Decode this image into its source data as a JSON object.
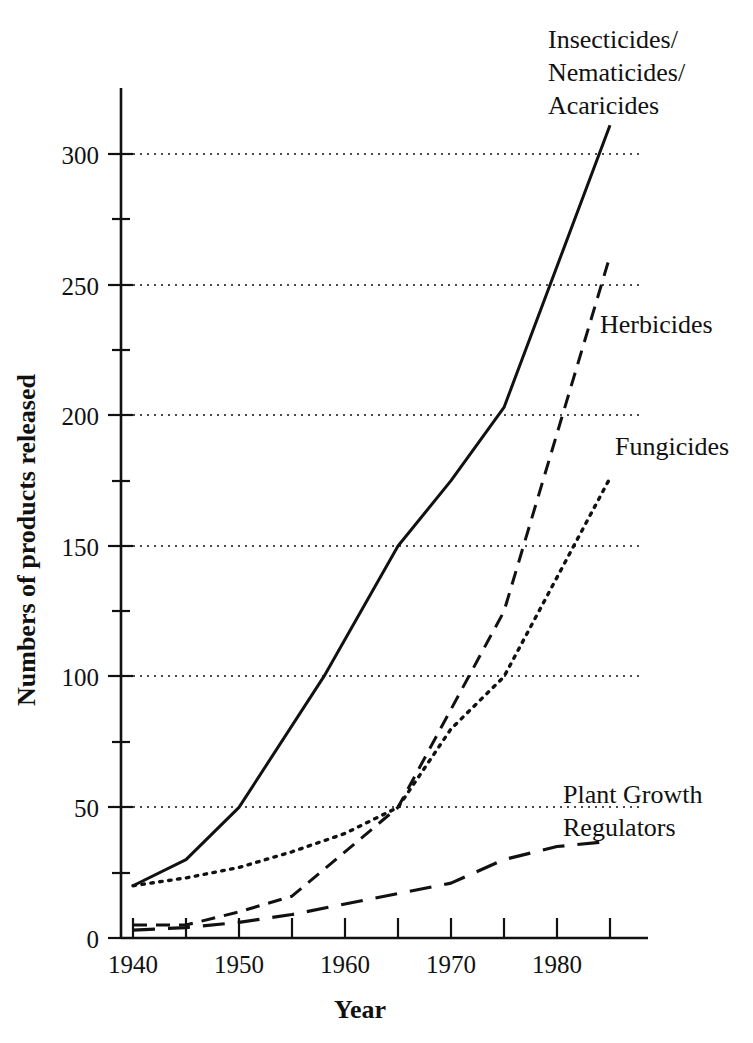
{
  "chart_data": {
    "type": "line",
    "title": "",
    "xlabel": "Year",
    "ylabel": "Numbers of products released",
    "xlim": [
      1940,
      1987
    ],
    "ylim": [
      0,
      320
    ],
    "grid": true,
    "grid_axis": "y",
    "legend": "inline-series-labels",
    "x_ticks_major": [
      1940,
      1950,
      1960,
      1970,
      1980
    ],
    "x_ticks_minor": [
      1945,
      1955,
      1965,
      1975,
      1985
    ],
    "x_tick_labels": [
      "1940",
      "1950",
      "1960",
      "1970",
      "1980"
    ],
    "y_ticks_major": [
      0,
      50,
      100,
      150,
      200,
      250,
      300
    ],
    "y_ticks_minor": [
      25,
      75,
      125,
      175,
      225,
      275
    ],
    "y_tick_labels": [
      "0",
      "50",
      "100",
      "150",
      "200",
      "250",
      "300"
    ],
    "series": [
      {
        "name": "Insecticides/\nNematicides/\nAcaricides",
        "label": "Insecticides/",
        "label_line2": "Nematicides/",
        "label_line3": "Acaricides",
        "style": "solid",
        "x": [
          1940,
          1945,
          1950,
          1958,
          1965,
          1970,
          1975,
          1985
        ],
        "values": [
          20,
          30,
          50,
          100,
          150,
          175,
          203,
          311
        ]
      },
      {
        "name": "Herbicides",
        "label": "Herbicides",
        "style": "dashed",
        "x": [
          1940,
          1945,
          1950,
          1955,
          1965,
          1975,
          1985
        ],
        "values": [
          5,
          5,
          10,
          16,
          50,
          125,
          261
        ]
      },
      {
        "name": "Fungicides",
        "label": "Fungicides",
        "style": "dotted",
        "x": [
          1940,
          1945,
          1950,
          1955,
          1960,
          1965,
          1970,
          1975,
          1985
        ],
        "values": [
          20,
          23,
          27,
          33,
          40,
          50,
          80,
          100,
          176
        ]
      },
      {
        "name": "Plant Growth Regulators",
        "label": "Plant Growth",
        "label_line2": "Regulators",
        "style": "long-dash",
        "x": [
          1940,
          1945,
          1950,
          1955,
          1960,
          1965,
          1970,
          1975,
          1980,
          1985
        ],
        "values": [
          3,
          4,
          6,
          9,
          13,
          17,
          21,
          30,
          35,
          37
        ]
      }
    ]
  },
  "colors": {
    "ink": "#111111",
    "background": "#ffffff"
  }
}
